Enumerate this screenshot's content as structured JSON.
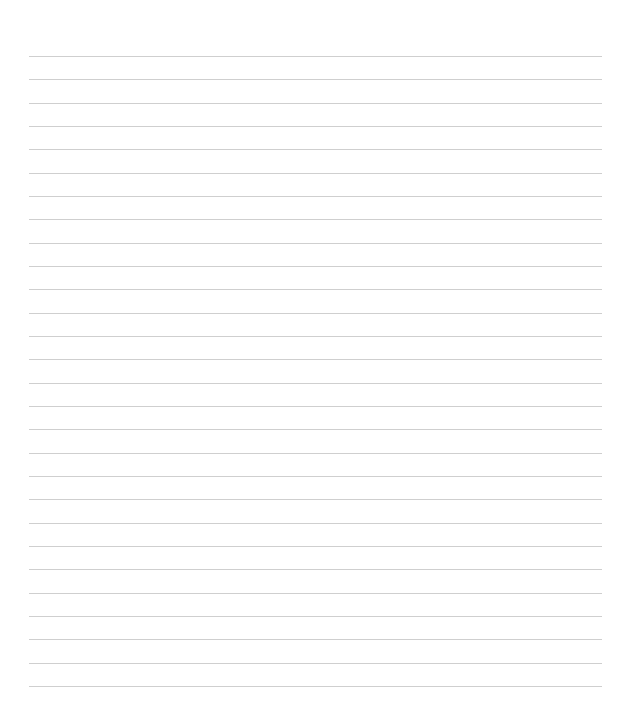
{
  "page": {
    "type": "lined-paper",
    "line_count": 28,
    "first_line_y": 56,
    "line_spacing": 23.33,
    "line_left": 29,
    "line_right": 602,
    "colors": {
      "background": "#ffffff",
      "rule": "#cfcfcf"
    },
    "text": []
  }
}
